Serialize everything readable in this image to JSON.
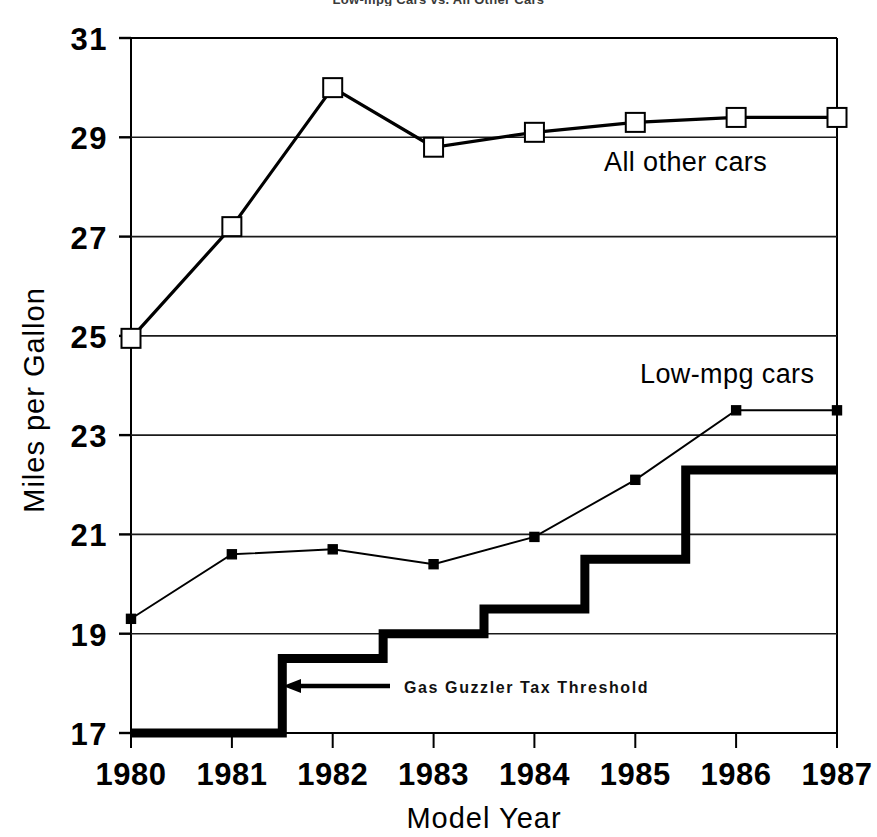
{
  "chart_data": {
    "type": "line",
    "title": "Low-mpg Cars vs. All Other Cars",
    "xlabel": "Model Year",
    "ylabel": "Miles per Gallon",
    "x": [
      1980,
      1981,
      1982,
      1983,
      1984,
      1985,
      1986,
      1987
    ],
    "xtick_labels": [
      "1980",
      "1981",
      "1982",
      "1983",
      "1984",
      "1985",
      "1986",
      "1987"
    ],
    "ytick_labels": [
      "31",
      "29",
      "27",
      "25",
      "23",
      "21",
      "19",
      "17"
    ],
    "yticks": [
      31,
      29,
      27,
      25,
      23,
      21,
      19,
      17
    ],
    "xlim": [
      1980,
      1987
    ],
    "ylim": [
      17,
      31
    ],
    "grid": "horizontal",
    "legend_position": "inline-annotation",
    "series": [
      {
        "name": "All other cars",
        "marker": "open-square",
        "values": [
          24.95,
          27.2,
          30.0,
          28.8,
          29.1,
          29.3,
          29.4,
          29.4
        ]
      },
      {
        "name": "Low-mpg cars",
        "marker": "filled-square",
        "values": [
          19.3,
          20.6,
          20.7,
          20.4,
          20.95,
          22.1,
          23.5,
          23.5
        ]
      }
    ],
    "step_series": {
      "name": "Gas Guzzler Tax Threshold",
      "style": "step-bold",
      "steps": [
        {
          "x_start": 1980.0,
          "x_end": 1981.5,
          "value": 17.0
        },
        {
          "x_start": 1981.5,
          "x_end": 1982.5,
          "value": 18.5
        },
        {
          "x_start": 1982.5,
          "x_end": 1983.5,
          "value": 19.0
        },
        {
          "x_start": 1983.5,
          "x_end": 1984.5,
          "value": 19.5
        },
        {
          "x_start": 1984.5,
          "x_end": 1985.5,
          "value": 20.5
        },
        {
          "x_start": 1985.5,
          "x_end": 1987.0,
          "value": 22.3
        }
      ]
    },
    "annotations": [
      {
        "text": "Gas Guzzler Tax Threshold",
        "arrow": "left-arrow",
        "x": 1982.2,
        "y": 17.75
      }
    ]
  },
  "labels": {
    "series_all_other": "All other cars",
    "series_low_mpg": "Low-mpg cars",
    "annotation_threshold": "Gas Guzzler Tax Threshold",
    "y_axis_title": "Miles per Gallon",
    "x_axis_title": "Model Year",
    "title": "Low-mpg Cars vs. All Other Cars",
    "ytick_0": "31",
    "ytick_1": "29",
    "ytick_2": "27",
    "ytick_3": "25",
    "ytick_4": "23",
    "ytick_5": "21",
    "ytick_6": "19",
    "ytick_7": "17",
    "xtick_0": "1980",
    "xtick_1": "1981",
    "xtick_2": "1982",
    "xtick_3": "1983",
    "xtick_4": "1984",
    "xtick_5": "1985",
    "xtick_6": "1986",
    "xtick_7": "1987"
  },
  "colors": {
    "ink": "#000000",
    "background": "#ffffff",
    "grid": "#1a1a1a"
  }
}
